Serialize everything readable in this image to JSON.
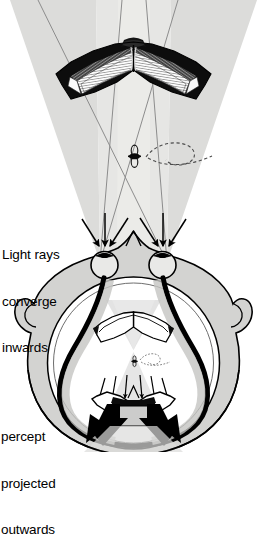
{
  "figure": {
    "type": "diagram",
    "background_color": "#ffffff",
    "ink_color": "#000000",
    "light_cone_color": "#d8d8d6",
    "head_fill_color": "#d0d0ce",
    "percept_fill_color": "#ffffff"
  },
  "labels": {
    "converge": "Light rays\nconverge\ninwards",
    "converge_lines": [
      "Light rays",
      "converge",
      "inwards"
    ],
    "percept": "percept\nprojected\noutwards",
    "percept_lines": [
      "percept",
      "projected",
      "outwards"
    ]
  },
  "objects": {
    "book_top": {
      "name": "open-book",
      "description": "open book seen from above, pages splayed, dark cover",
      "cover_color": "#111111",
      "page_color": "#fbfbfb",
      "page_shade_color": "#6a6a6a"
    },
    "fly": {
      "name": "fly",
      "description": "small fly with dashed looping flight path",
      "path_style": "dashed"
    },
    "head": {
      "name": "head-top-view",
      "description": "top-down view of a human head with nose, two ears, two eyes, optic nerves",
      "eyes": 2,
      "ears": 2,
      "optic_nerve_color": "#000000"
    },
    "percept_circle": {
      "name": "percept-sphere",
      "description": "inner circle representing the internal percept containing a small book and fly"
    },
    "book_percept": {
      "name": "percept-book",
      "description": "small outline book inside percept circle"
    },
    "book_projected": {
      "name": "projected-book",
      "description": "inverted book at bottom with large solid black arrows projecting outwards"
    },
    "arrows_in": {
      "name": "converging-light-ray-arrows",
      "count": 6,
      "description": "thin arrows pointing down/inwards toward each eye"
    },
    "arrows_out": {
      "name": "projection-arrows",
      "count": 2,
      "description": "large solid black arrows pointing outwards/downwards"
    }
  }
}
